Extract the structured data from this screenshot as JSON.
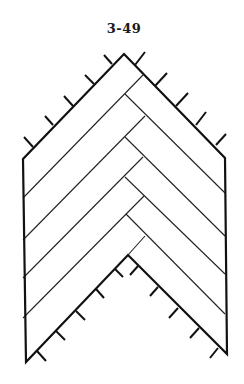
{
  "figure": {
    "label": "3-49",
    "outline_points": [
      [
        124,
        54
      ],
      [
        225,
        158
      ],
      [
        227,
        354
      ],
      [
        128,
        255
      ],
      [
        26,
        362
      ],
      [
        23,
        159
      ]
    ],
    "down_left_boards": [
      [
        [
          143,
          75
        ],
        [
          23,
          198
        ]
      ],
      [
        [
          145,
          116
        ],
        [
          23,
          240
        ]
      ],
      [
        [
          143,
          157
        ],
        [
          23,
          278
        ]
      ],
      [
        [
          144,
          196
        ],
        [
          23,
          318
        ]
      ],
      [
        [
          145,
          236
        ],
        [
          128,
          255
        ]
      ]
    ],
    "down_right_boards": [
      [
        [
          125,
          94
        ],
        [
          225,
          193
        ]
      ],
      [
        [
          125,
          137
        ],
        [
          225,
          236
        ]
      ],
      [
        [
          125,
          177
        ],
        [
          225,
          274
        ]
      ],
      [
        [
          126,
          214
        ],
        [
          225,
          314
        ]
      ]
    ],
    "ticks": {
      "top_left": [
        [
          [
            112,
            64
          ],
          [
            104,
            55
          ]
        ],
        [
          [
            94,
            84
          ],
          [
            85,
            75
          ]
        ],
        [
          [
            73,
            106
          ],
          [
            64,
            96
          ]
        ],
        [
          [
            53,
            125
          ],
          [
            45,
            116
          ]
        ],
        [
          [
            33,
            147
          ],
          [
            24,
            137
          ]
        ]
      ],
      "top_right": [
        [
          [
            135,
            65
          ],
          [
            145,
            52
          ]
        ],
        [
          [
            155,
            86
          ],
          [
            167,
            73
          ]
        ],
        [
          [
            176,
            106
          ],
          [
            188,
            93
          ]
        ],
        [
          [
            196,
            125
          ],
          [
            206,
            112
          ]
        ],
        [
          [
            216,
            145
          ],
          [
            226,
            134
          ]
        ]
      ],
      "bottom_left": [
        [
          [
            115,
            269
          ],
          [
            123,
            277
          ]
        ],
        [
          [
            96,
            289
          ],
          [
            104,
            298
          ]
        ],
        [
          [
            76,
            311
          ],
          [
            85,
            320
          ]
        ],
        [
          [
            56,
            331
          ],
          [
            65,
            340
          ]
        ],
        [
          [
            37,
            351
          ],
          [
            46,
            361
          ]
        ]
      ],
      "bottom_right": [
        [
          [
            138,
            266
          ],
          [
            130,
            275
          ]
        ],
        [
          [
            158,
            287
          ],
          [
            150,
            296
          ]
        ],
        [
          [
            178,
            308
          ],
          [
            169,
            318
          ]
        ],
        [
          [
            199,
            328
          ],
          [
            190,
            338
          ]
        ],
        [
          [
            218,
            348
          ],
          [
            210,
            358
          ]
        ]
      ]
    }
  }
}
